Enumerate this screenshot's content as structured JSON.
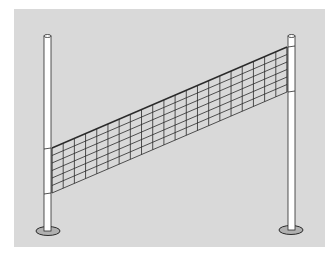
{
  "illustration": {
    "subject": "volleyball-net",
    "colors": {
      "page_background": "#ffffff",
      "panel_background": "#d9d9d9",
      "line": "#2a2a2a",
      "pole_fill": "#ffffff",
      "base_fill": "#b0b0b0"
    },
    "net": {
      "columns": 21,
      "rows": 6
    }
  }
}
